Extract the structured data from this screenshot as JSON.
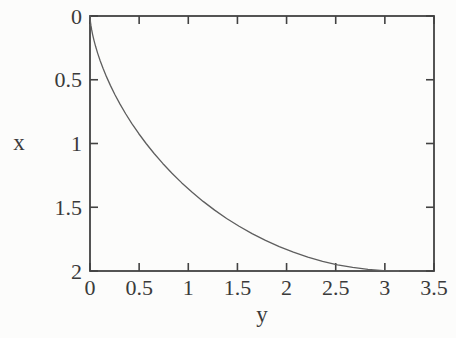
{
  "figure": {
    "background_color": "#fcfcfb"
  },
  "chart_data": {
    "type": "line",
    "title": "",
    "xlabel": "y",
    "ylabel": "x",
    "xlim": [
      0,
      3.5
    ],
    "ylim": [
      0,
      2
    ],
    "y_axis_inverted": true,
    "grid": false,
    "legend": "none",
    "box_border": true,
    "ticks_inward_all_sides": true,
    "x_ticks": [
      0,
      0.5,
      1,
      1.5,
      2,
      2.5,
      3,
      3.5
    ],
    "x_tick_labels": [
      "0",
      "0.5",
      "1",
      "1.5",
      "2",
      "2.5",
      "3",
      "3.5"
    ],
    "y_ticks": [
      0,
      0.5,
      1,
      1.5,
      2
    ],
    "y_tick_labels": [
      "0",
      "0.5",
      "1",
      "1.5",
      "2"
    ],
    "axis_color": "#424242",
    "curve_color": "#5e5e5e",
    "text_color": "#3a3a3a",
    "series": [
      {
        "name": "curve",
        "points_yx": [
          [
            0,
            0
          ],
          [
            0.0001,
            0.0031
          ],
          [
            0.0006,
            0.0123
          ],
          [
            0.0022,
            0.0276
          ],
          [
            0.0051,
            0.0489
          ],
          [
            0.01,
            0.0761
          ],
          [
            0.0172,
            0.109
          ],
          [
            0.0273,
            0.1474
          ],
          [
            0.0405,
            0.191
          ],
          [
            0.0574,
            0.2396
          ],
          [
            0.0783,
            0.2929
          ],
          [
            0.1035,
            0.3506
          ],
          [
            0.1335,
            0.4122
          ],
          [
            0.1684,
            0.4775
          ],
          [
            0.2086,
            0.546
          ],
          [
            0.2542,
            0.6173
          ],
          [
            0.3056,
            0.691
          ],
          [
            0.3628,
            0.7666
          ],
          [
            0.426,
            0.8436
          ],
          [
            0.4953,
            0.9215
          ],
          [
            0.5708,
            1.0
          ],
          [
            0.6524,
            1.0785
          ],
          [
            0.7402,
            1.1564
          ],
          [
            0.834,
            1.2334
          ],
          [
            0.9339,
            1.309
          ],
          [
            1.0396,
            1.3827
          ],
          [
            1.151,
            1.454
          ],
          [
            1.2679,
            1.5225
          ],
          [
            1.3901,
            1.5878
          ],
          [
            1.5172,
            1.6494
          ],
          [
            1.6491,
            1.7071
          ],
          [
            1.7853,
            1.7604
          ],
          [
            1.9255,
            1.809
          ],
          [
            2.0693,
            1.8526
          ],
          [
            2.2164,
            1.891
          ],
          [
            2.3662,
            1.9239
          ],
          [
            2.5184,
            1.9511
          ],
          [
            2.6725,
            1.9724
          ],
          [
            2.8281,
            1.9877
          ],
          [
            2.9846,
            1.9969
          ],
          [
            3.1416,
            2.0
          ]
        ]
      }
    ]
  }
}
